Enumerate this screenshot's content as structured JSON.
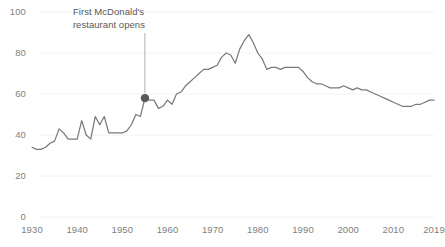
{
  "chart_data": {
    "type": "line",
    "title": "",
    "subtitle": "",
    "xlabel": "",
    "ylabel": "",
    "xlim": [
      1930,
      2019
    ],
    "ylim": [
      0,
      100
    ],
    "grid": true,
    "grid_axis": "y",
    "legend": false,
    "legend_position": "none",
    "line_color": "#7a7a7a",
    "grid_color": "#f2f2f2",
    "tick_label_color": "#808080",
    "annotation_color": "#595959",
    "marker_color": "#595959",
    "y_ticks": [
      0,
      20,
      40,
      60,
      80,
      100
    ],
    "x_ticks": [
      1930,
      1940,
      1950,
      1960,
      1970,
      1980,
      1990,
      2000,
      2010,
      2019
    ],
    "annotations": [
      {
        "text_line1": "First McDonald's",
        "text_line2": "restaurant opens",
        "point_x": 1955,
        "point_y": 58,
        "marker": true
      }
    ],
    "x": [
      1930,
      1931,
      1932,
      1933,
      1934,
      1935,
      1936,
      1937,
      1938,
      1939,
      1940,
      1941,
      1942,
      1943,
      1944,
      1945,
      1946,
      1947,
      1948,
      1949,
      1950,
      1951,
      1952,
      1953,
      1954,
      1955,
      1956,
      1957,
      1958,
      1959,
      1960,
      1961,
      1962,
      1963,
      1964,
      1965,
      1966,
      1967,
      1968,
      1969,
      1970,
      1971,
      1972,
      1973,
      1974,
      1975,
      1976,
      1977,
      1978,
      1979,
      1980,
      1981,
      1982,
      1983,
      1984,
      1985,
      1986,
      1987,
      1988,
      1989,
      1990,
      1991,
      1992,
      1993,
      1994,
      1995,
      1996,
      1997,
      1998,
      1999,
      2000,
      2001,
      2002,
      2003,
      2004,
      2005,
      2006,
      2007,
      2008,
      2009,
      2010,
      2011,
      2012,
      2013,
      2014,
      2015,
      2016,
      2017,
      2018,
      2019
    ],
    "y": [
      34,
      33,
      33,
      34,
      36,
      37,
      43,
      41,
      38,
      38,
      38,
      47,
      40,
      38,
      49,
      45,
      49,
      41,
      41,
      41,
      41,
      42,
      45,
      50,
      49,
      58,
      57,
      57,
      53,
      54,
      57,
      55,
      60,
      61,
      64,
      66,
      68,
      70,
      72,
      72,
      73,
      74,
      78,
      80,
      79,
      75,
      82,
      86,
      89,
      85,
      80,
      77,
      72,
      73,
      73,
      72,
      73,
      73,
      73,
      73,
      71,
      68,
      66,
      65,
      65,
      64,
      63,
      63,
      63,
      64,
      63,
      62,
      63,
      62,
      62,
      61,
      60,
      59,
      58,
      57,
      56,
      55,
      54,
      54,
      54,
      55,
      55,
      56,
      57,
      57
    ],
    "series": [
      {
        "name": "value",
        "values": [
          34,
          33,
          33,
          34,
          36,
          37,
          43,
          41,
          38,
          38,
          38,
          47,
          40,
          38,
          49,
          45,
          49,
          41,
          41,
          41,
          41,
          42,
          45,
          50,
          49,
          58,
          57,
          57,
          53,
          54,
          57,
          55,
          60,
          61,
          64,
          66,
          68,
          70,
          72,
          72,
          73,
          74,
          78,
          80,
          79,
          75,
          82,
          86,
          89,
          85,
          80,
          77,
          72,
          73,
          73,
          72,
          73,
          73,
          73,
          73,
          71,
          68,
          66,
          65,
          65,
          64,
          63,
          63,
          63,
          64,
          63,
          62,
          63,
          62,
          62,
          61,
          60,
          59,
          58,
          57,
          56,
          55,
          54,
          54,
          54,
          55,
          55,
          56,
          57,
          57
        ]
      }
    ]
  },
  "axis": {
    "y_labels": [
      "100",
      "80",
      "60",
      "40",
      "20",
      "0"
    ],
    "x_labels": [
      "1930",
      "1940",
      "1950",
      "1960",
      "1970",
      "1980",
      "1990",
      "2000",
      "2010",
      "2019"
    ]
  },
  "annotation": {
    "line1": "First McDonald's",
    "line2": "restaurant opens"
  }
}
